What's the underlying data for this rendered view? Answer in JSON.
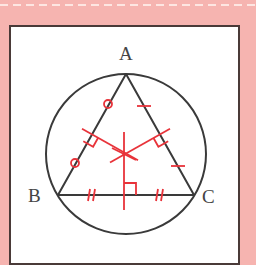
{
  "figure": {
    "vertices": {
      "A": {
        "label": "A",
        "x": 126,
        "y": 74
      },
      "B": {
        "label": "B",
        "x": 58,
        "y": 195
      },
      "C": {
        "label": "C",
        "x": 194,
        "y": 195
      }
    },
    "circle": {
      "cx": 126,
      "cy": 154,
      "r": 80
    },
    "circumcenter": {
      "x": 124,
      "y": 154
    },
    "colors": {
      "background": "#f6b4b0",
      "dash": "#fde6e2",
      "card": "#ffffff",
      "frame": "#4a3a38",
      "stroke": "#3a3a3a",
      "accent": "#e8333a"
    },
    "marks": {
      "AB": "circle tick marks (equal halves)",
      "AC": "single tick marks (equal halves)",
      "BC": "double tick marks (equal halves)"
    }
  }
}
